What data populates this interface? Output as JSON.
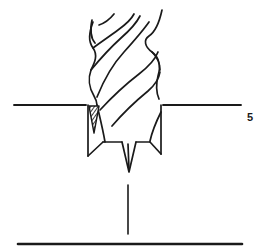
{
  "figure": {
    "label": "5",
    "background_color": "#ffffff",
    "line_color": "#1a1a1a"
  },
  "diagram": {
    "type": "technical-line-drawing",
    "elements": [
      {
        "name": "workpiece-surface-line-left",
        "description": "horizontal surface line left of drill",
        "x1": 14,
        "y1": 105,
        "x2": 85,
        "y2": 105
      },
      {
        "name": "workpiece-surface-line-right",
        "description": "horizontal surface line right of drill",
        "x1": 163,
        "y1": 105,
        "x2": 241,
        "y2": 105
      },
      {
        "name": "baseline-thick",
        "description": "thick horizontal base rule at bottom",
        "x1": 18,
        "y1": 244,
        "x2": 242,
        "y2": 244
      },
      {
        "name": "centerline-vertical",
        "description": "vertical axis centerline below drill tip",
        "x1": 128,
        "y1": 185,
        "x2": 128,
        "y2": 234
      },
      {
        "name": "hatched-wedge",
        "description": "dark hatched triangular chip wedge at left cutting lip"
      }
    ]
  },
  "colors": {
    "ink": "#1a1a1a",
    "paper": "#ffffff",
    "hatch": "#2b2b2b"
  }
}
